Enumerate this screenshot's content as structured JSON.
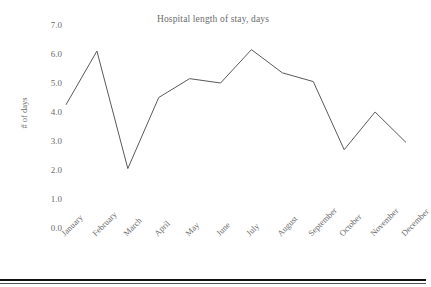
{
  "chart_data": {
    "type": "line",
    "title": "Hospital length of stay, days",
    "xlabel": "",
    "ylabel": "# of days",
    "categories": [
      "January",
      "February",
      "March",
      "April",
      "May",
      "June",
      "July",
      "August",
      "September",
      "October",
      "November",
      "December"
    ],
    "values": [
      4.25,
      6.1,
      2.05,
      4.5,
      5.15,
      5.0,
      6.15,
      5.35,
      5.05,
      2.7,
      4.0,
      2.95
    ],
    "series": [
      {
        "name": "Hospital length of stay, days",
        "values": [
          4.25,
          6.1,
          2.05,
          4.5,
          5.15,
          5.0,
          6.15,
          5.35,
          5.05,
          2.7,
          4.0,
          2.95
        ]
      }
    ],
    "ylim": [
      0.0,
      7.0
    ],
    "ytick_labels": [
      "0.0",
      "1.0",
      "2.0",
      "3.0",
      "4.0",
      "5.0",
      "6.0",
      "7.0"
    ],
    "ytick_values": [
      0.0,
      1.0,
      2.0,
      3.0,
      4.0,
      5.0,
      6.0,
      7.0
    ],
    "grid": false,
    "legend": false,
    "legend_position": "none",
    "markers": false,
    "line_color": "#595959",
    "background_color": "#ffffff",
    "text_color": "#6b6b6b",
    "xtick_rotation_degrees": -45
  }
}
